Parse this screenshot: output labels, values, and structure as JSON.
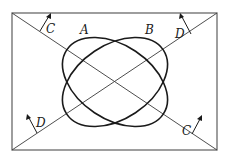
{
  "diagram": {
    "frame": {
      "x1": 12,
      "y1": 13,
      "x2": 217,
      "y2": 150
    },
    "diagonals": [
      {
        "id": "C",
        "from": "top-left",
        "to": "bottom-right"
      },
      {
        "id": "D",
        "from": "bottom-left",
        "to": "top-right"
      }
    ],
    "ellipses": [
      {
        "label": "A",
        "orientation": "along diagonal C (top-left to bottom-right)"
      },
      {
        "label": "B",
        "orientation": "along diagonal D (bottom-left to top-right)"
      }
    ],
    "labels": {
      "ellipse_a": "A",
      "ellipse_b": "B",
      "c_top_left": "C",
      "c_bottom_right": "C",
      "d_top_right": "D",
      "d_bottom_left": "D"
    },
    "arrows": [
      {
        "label": "C",
        "position": "upper-left on diagonal C",
        "direction": "perpendicular, pointing up-right"
      },
      {
        "label": "D",
        "position": "upper-right on diagonal D",
        "direction": "perpendicular, pointing up-left"
      },
      {
        "label": "D",
        "position": "lower-left on diagonal D",
        "direction": "perpendicular, pointing up-left"
      },
      {
        "label": "C",
        "position": "lower-right on diagonal C",
        "direction": "perpendicular, pointing up-right"
      }
    ],
    "colors": {
      "line": "#1a1a1a",
      "frame": "#6a6a6a",
      "background": "#ffffff"
    }
  }
}
